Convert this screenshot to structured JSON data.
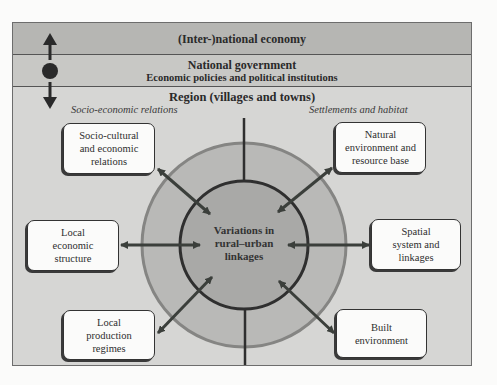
{
  "diagram": {
    "levels": {
      "international": "(Inter-)national economy",
      "national_title": "National government",
      "national_subtitle": "Economic policies and political institutions",
      "region": "Region (villages and towns)"
    },
    "section_labels": {
      "left": "Socio-economic relations",
      "right": "Settlements and habitat"
    },
    "center": {
      "line1": "Variations in",
      "line2": "rural–urban",
      "line3": "linkages"
    },
    "boxes": [
      {
        "id": "socio-cultural",
        "lines": [
          "Socio-cultural",
          "and economic",
          "relations"
        ]
      },
      {
        "id": "natural-environment",
        "lines": [
          "Natural",
          "environment and",
          "resource base"
        ]
      },
      {
        "id": "local-economic",
        "lines": [
          "Local",
          "economic",
          "structure"
        ]
      },
      {
        "id": "spatial-system",
        "lines": [
          "Spatial",
          "system and",
          "linkages"
        ]
      },
      {
        "id": "local-production",
        "lines": [
          "Local",
          "production",
          "regimes"
        ]
      },
      {
        "id": "built-environment",
        "lines": [
          "Built",
          "environment"
        ]
      }
    ],
    "colors": {
      "band_international": "#b6b6b3",
      "band_national": "#c8c8c5",
      "band_region": "#d6d6d4",
      "outer_ring": "#b9b9b7",
      "inner_circle": "#a9a9a7",
      "arrow": "#3b3f3b",
      "box_fill": "#fbfbfa"
    }
  }
}
